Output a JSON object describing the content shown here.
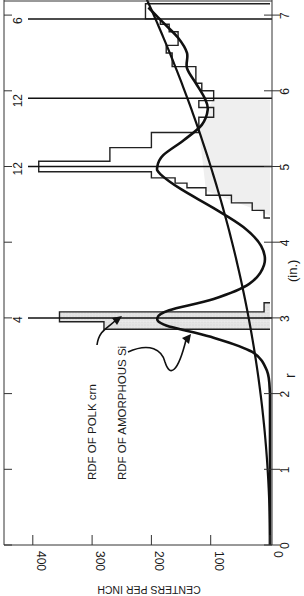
{
  "chart_data": {
    "type": "bar+line",
    "orientation": "rotated 90 degrees counterclockwise (x-axis vertical, increasing upward)",
    "title": "",
    "xlabel": "r",
    "xlabel_unit": "(in.)",
    "ylabel": "CENTERS PER INCH",
    "xlim": [
      0,
      7.2
    ],
    "ylim": [
      0,
      450
    ],
    "x_ticks": [
      0,
      1,
      2,
      3,
      4,
      5,
      6,
      7
    ],
    "y_ticks": [
      0,
      100,
      200,
      300,
      400
    ],
    "grid": false,
    "annotations": [
      {
        "text": "RDF OF POLK crn",
        "points_to": "histogram at r≈2.9"
      },
      {
        "text": "RDF OF AMORPHOUS Si",
        "points_to": "smooth curve at r≈2.8"
      }
    ],
    "delta_peaks": [
      {
        "r": 3.0,
        "label": "4"
      },
      {
        "r": 5.0,
        "label": "12"
      },
      {
        "r": 5.9,
        "label": "12"
      },
      {
        "r": 6.95,
        "label": "6"
      }
    ],
    "series": [
      {
        "name": "RDF OF POLK crn",
        "kind": "histogram",
        "bins": [
          {
            "r0": 2.85,
            "r1": 2.95,
            "value": 280
          },
          {
            "r0": 2.95,
            "r1": 3.08,
            "value": 355
          },
          {
            "r0": 3.08,
            "r1": 3.2,
            "value": 10
          },
          {
            "r0": 4.32,
            "r1": 4.42,
            "value": 10
          },
          {
            "r0": 4.42,
            "r1": 4.52,
            "value": 30
          },
          {
            "r0": 4.52,
            "r1": 4.62,
            "value": 65
          },
          {
            "r0": 4.62,
            "r1": 4.72,
            "value": 108
          },
          {
            "r0": 4.72,
            "r1": 4.78,
            "value": 140
          },
          {
            "r0": 4.78,
            "r1": 4.85,
            "value": 160
          },
          {
            "r0": 4.85,
            "r1": 4.93,
            "value": 200
          },
          {
            "r0": 4.93,
            "r1": 5.07,
            "value": 390
          },
          {
            "r0": 5.07,
            "r1": 5.25,
            "value": 270
          },
          {
            "r0": 5.25,
            "r1": 5.45,
            "value": 200
          },
          {
            "r0": 5.45,
            "r1": 5.65,
            "value": 120
          },
          {
            "r0": 5.65,
            "r1": 5.78,
            "value": 95
          },
          {
            "r0": 5.78,
            "r1": 5.87,
            "value": 120
          },
          {
            "r0": 5.87,
            "r1": 6.0,
            "value": 95
          },
          {
            "r0": 6.0,
            "r1": 6.1,
            "value": 115
          },
          {
            "r0": 6.1,
            "r1": 6.32,
            "value": 125
          },
          {
            "r0": 6.32,
            "r1": 6.5,
            "value": 165
          },
          {
            "r0": 6.5,
            "r1": 6.6,
            "value": 175
          },
          {
            "r0": 6.6,
            "r1": 6.78,
            "value": 155
          },
          {
            "r0": 6.78,
            "r1": 6.88,
            "value": 170
          },
          {
            "r0": 6.88,
            "r1": 6.95,
            "value": 185
          },
          {
            "r0": 6.95,
            "r1": 7.15,
            "value": 210
          }
        ]
      },
      {
        "name": "RDF OF AMORPHOUS Si",
        "kind": "smooth",
        "x": [
          2.0,
          2.3,
          2.55,
          2.75,
          2.9,
          3.0,
          3.1,
          3.25,
          3.45,
          3.7,
          3.95,
          4.2,
          4.45,
          4.7,
          4.9,
          5.0,
          5.15,
          5.35,
          5.55,
          5.75,
          5.9,
          6.1,
          6.3,
          6.5,
          6.7,
          6.9,
          7.1
        ],
        "y": [
          0,
          5,
          30,
          100,
          175,
          190,
          170,
          95,
          35,
          10,
          15,
          45,
          95,
          150,
          185,
          190,
          180,
          145,
          115,
          105,
          110,
          125,
          140,
          140,
          155,
          180,
          205
        ]
      },
      {
        "name": "average density 4πr²ρ",
        "kind": "line",
        "x": [
          0,
          1,
          2,
          3,
          4,
          5,
          6,
          7,
          7.2
        ],
        "y": [
          0,
          4,
          16,
          36,
          64,
          100,
          145,
          196,
          210
        ]
      }
    ]
  },
  "labels": {
    "xlabel": "r",
    "xunit": "(in.)",
    "ylabel": "CENTERS PER INCH",
    "annotation_polk": "RDF OF POLK crn",
    "annotation_si": "RDF OF AMORPHOUS Si",
    "x_tick_labels": [
      "0",
      "1",
      "2",
      "3",
      "4",
      "5",
      "6",
      "7"
    ],
    "y_tick_labels": [
      "0",
      "100",
      "200",
      "300",
      "400"
    ],
    "peak_labels": [
      "4",
      "12",
      "12",
      "6"
    ]
  }
}
